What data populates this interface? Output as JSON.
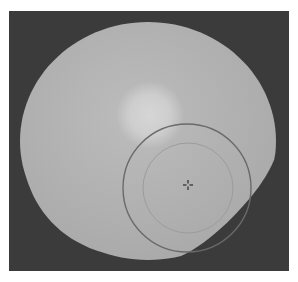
{
  "image": {
    "width": 298,
    "height": 282,
    "background": "#ffffff",
    "frame": {
      "x": 9,
      "y": 11,
      "width": 280,
      "height": 260,
      "color": "#3b3b3b"
    },
    "field_disc": {
      "cx": 148,
      "cy": 141,
      "rx": 128,
      "ry": 119,
      "color": "#bcbcbc",
      "edge_color": "#a9a9a9"
    },
    "bright_spot": {
      "cx": 150,
      "cy": 115,
      "r": 34,
      "color": "#d6d6d6"
    },
    "overlays": {
      "outer_circle": {
        "cx": 187,
        "cy": 188,
        "r": 64,
        "stroke": "#6a6a6a",
        "stroke_width": 1.4
      },
      "inner_circle": {
        "cx": 188,
        "cy": 188,
        "r": 45,
        "stroke": "#9c9c9c",
        "stroke_width": 1
      },
      "center_marker": {
        "x": 188,
        "y": 185,
        "size": 5,
        "color": "#333333",
        "icon": "crosshair-icon"
      }
    }
  }
}
